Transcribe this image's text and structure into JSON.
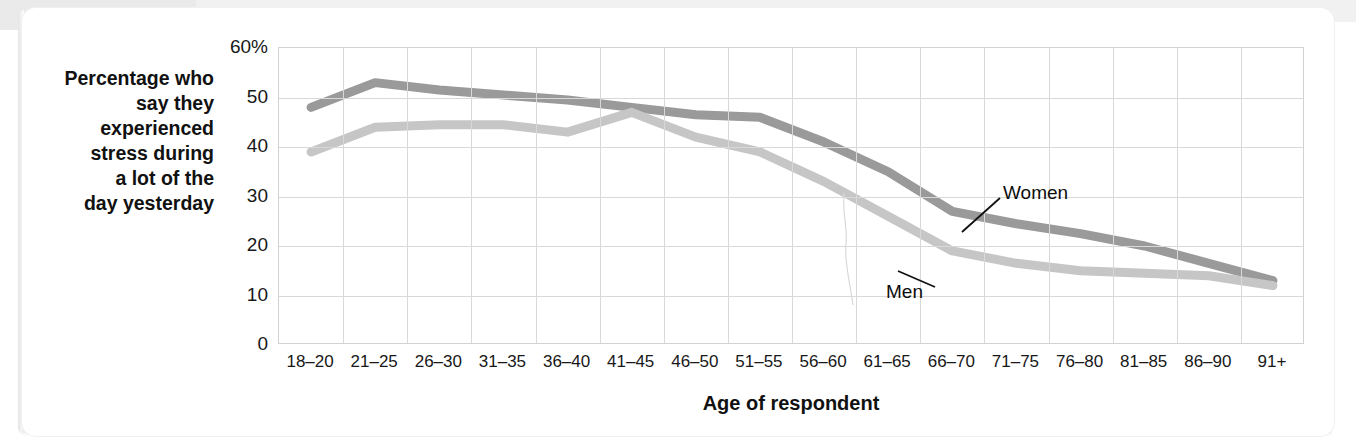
{
  "figure": {
    "y_axis_title": "Percentage who say they experienced stress during a lot of the day yesterday",
    "y_axis_title_lines": [
      "Percentage who",
      "say they",
      "experienced",
      "stress during",
      "a lot of the",
      "day yesterday"
    ],
    "x_axis_title": "Age of respondent"
  },
  "colors": {
    "women_line": "#9a9a9a",
    "men_line": "#c6c6c6",
    "gridline": "#d8d8d8",
    "plot_border": "#d2d2d2",
    "text": "#181818",
    "card_background": "#ffffff",
    "page_band": "#f1f1f1"
  },
  "chart_data": {
    "type": "line",
    "title": "",
    "subtitle": "",
    "xlabel": "Age of respondent",
    "ylabel": "Percentage who say they experienced stress during a lot of the day yesterday",
    "categories": [
      "18–20",
      "21–25",
      "26–30",
      "31–35",
      "36–40",
      "41–45",
      "46–50",
      "51–55",
      "56–60",
      "61–65",
      "66–70",
      "71–75",
      "76–80",
      "81–85",
      "86–90",
      "91+"
    ],
    "ylim": [
      0,
      60
    ],
    "yticks": [
      0,
      10,
      20,
      30,
      40,
      50,
      60
    ],
    "ytick_labels": [
      "0",
      "10",
      "20",
      "30",
      "40",
      "50",
      "60%"
    ],
    "grid": true,
    "legend_position": "inline-annotation",
    "series": [
      {
        "name": "Women",
        "color": "#9a9a9a",
        "values": [
          48,
          53,
          51.5,
          50.5,
          49.5,
          48,
          46.5,
          46,
          41,
          35,
          27,
          24.5,
          22.5,
          20,
          16.5,
          13
        ]
      },
      {
        "name": "Men",
        "color": "#c6c6c6",
        "values": [
          39,
          44,
          44.5,
          44.5,
          43,
          47,
          42,
          39,
          33,
          26,
          19,
          16.5,
          15,
          14.5,
          14,
          12
        ]
      }
    ],
    "annotations": [
      {
        "text": "Women",
        "series": "Women",
        "attaches_to_category": "66–70"
      },
      {
        "text": "Men",
        "series": "Men",
        "attaches_to_category": "61–65"
      }
    ]
  }
}
